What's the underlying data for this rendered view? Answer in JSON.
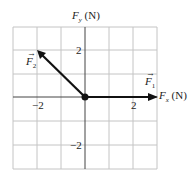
{
  "axes": {
    "x_label_var": "F",
    "x_label_sub": "x",
    "x_label_unit": "(N)",
    "y_label_var": "F",
    "y_label_sub": "y",
    "y_label_unit": "(N)"
  },
  "ticks": {
    "x_neg": "−2",
    "x_pos": "2",
    "y_pos": "2",
    "y_neg": "−2"
  },
  "vectors": [
    {
      "name": "F",
      "sub": "1",
      "from": [
        0,
        0
      ],
      "to": [
        3,
        0
      ]
    },
    {
      "name": "F",
      "sub": "2",
      "from": [
        0,
        0
      ],
      "to": [
        -2,
        2
      ]
    }
  ],
  "colors": {
    "grid": "#bbbbbb",
    "axis": "#333333",
    "vector": "#111111"
  }
}
